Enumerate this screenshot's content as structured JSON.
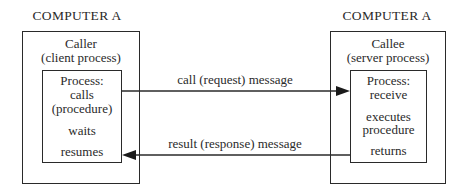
{
  "diagram": {
    "left": {
      "heading": "COMPUTER A",
      "role_title": "Caller",
      "role_subtitle": "(client process)",
      "process_lines": [
        "Process:",
        "calls",
        "(procedure)",
        "waits",
        "resumes"
      ]
    },
    "right": {
      "heading": "COMPUTER A",
      "role_title": "Callee",
      "role_subtitle": "(server process)",
      "process_lines": [
        "Process:",
        "receive",
        "executes",
        "procedure",
        "returns"
      ]
    },
    "arrows": {
      "request_label": "call (request) message",
      "response_label": "result (response) message"
    },
    "colors": {
      "line": "#2a2a2a",
      "background": "#ffffff"
    }
  }
}
